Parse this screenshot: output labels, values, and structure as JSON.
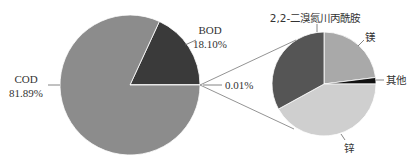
{
  "chart_data": {
    "type": "pie",
    "subtype": "pie-of-pie",
    "title": "",
    "main_pie": {
      "slices": [
        {
          "label": "COD",
          "value": 81.89,
          "display": "81.89%",
          "color": "#8c8c8c"
        },
        {
          "label": "BOD",
          "value": 18.1,
          "display": "18.10%",
          "color": "#3a3a3a"
        },
        {
          "label": "",
          "value": 0.01,
          "display": "0.01%",
          "color": "#8c8c8c"
        }
      ]
    },
    "secondary_pie": {
      "source_slice_label": "0.01%",
      "slices": [
        {
          "label": "镁",
          "value": 23,
          "color": "#a9a9a9"
        },
        {
          "label": "其他",
          "value": 2,
          "color": "#111111"
        },
        {
          "label": "锌",
          "value": 42,
          "color": "#cfcfcf"
        },
        {
          "label": "2,2-二溴氮川丙酰胺",
          "value": 33,
          "color": "#555555"
        }
      ]
    }
  },
  "labels": {
    "cod_name": "COD",
    "cod_pct": "81.89%",
    "bod_name": "BOD",
    "bod_pct": "18.10%",
    "other_pct": "0.01%",
    "mg": "镁",
    "other": "其他",
    "zn": "锌",
    "dbnpa": "2,2-二溴氮川丙酰胺"
  }
}
